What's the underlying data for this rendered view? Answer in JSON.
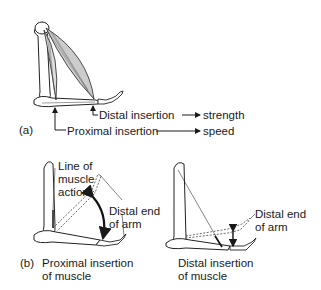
{
  "panel_a": {
    "tag": "(a)",
    "distal_label": "Distal insertion",
    "distal_result": "strength",
    "proximal_label": "Proximal insertion",
    "proximal_result": "speed"
  },
  "panel_b": {
    "tag": "(b)",
    "left": {
      "line_label_1": "Line of",
      "line_label_2": "muscle",
      "line_label_3": "action",
      "distal_end_1": "Distal end",
      "distal_end_2": "of arm",
      "caption_1": "Proximal insertion",
      "caption_2": "of muscle"
    },
    "right": {
      "distal_end_1": "Distal end",
      "distal_end_2": "of arm",
      "caption_1": "Distal insertion",
      "caption_2": "of muscle"
    }
  }
}
